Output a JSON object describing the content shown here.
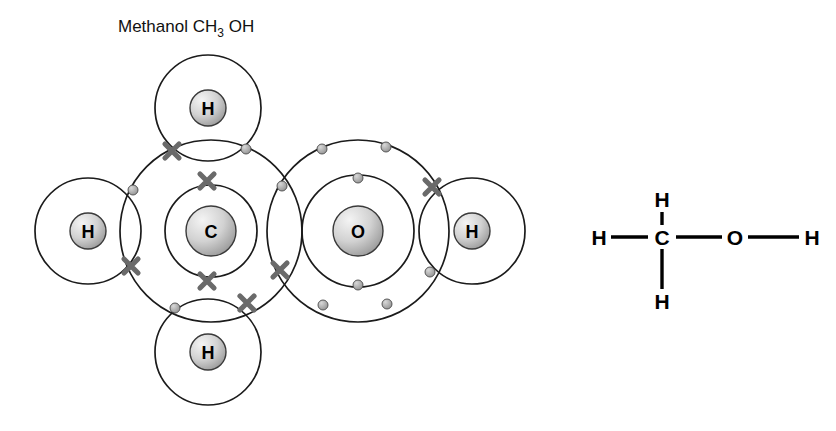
{
  "title": {
    "name_label": "Methanol",
    "formula_main": "CH",
    "formula_sub": "3",
    "formula_tail": "OH",
    "full_text": "Methanol CH3 OH"
  },
  "colors": {
    "background": "#ffffff",
    "shell_stroke": "#1b1b1b",
    "nucleus_fill_light": "#f2f2f2",
    "nucleus_fill_dark": "#9a9a9a",
    "nucleus_stroke": "#3a3a3a",
    "dot_fill": "#9b9b9b",
    "dot_stroke": "#4a4a4a",
    "cross_stroke": "#6a6a6a",
    "bond_stroke": "#000000",
    "text": "#000000"
  },
  "dot_cross_diagram": {
    "name": "dot-and-cross-diagram",
    "legend": {
      "cross_meaning": "carbon electron",
      "dot_meaning": "hydrogen or oxygen electron"
    },
    "atoms": [
      {
        "id": "carbon",
        "symbol": "C",
        "cx": 211,
        "cy": 231,
        "nucleus_r": 25,
        "shells": [
          46,
          91
        ]
      },
      {
        "id": "oxygen",
        "symbol": "O",
        "cx": 358,
        "cy": 231,
        "nucleus_r": 25,
        "shells": [
          56,
          91
        ]
      },
      {
        "id": "hydrogen-top",
        "symbol": "H",
        "cx": 208,
        "cy": 108,
        "nucleus_r": 18,
        "shells": [
          53
        ]
      },
      {
        "id": "hydrogen-bottom",
        "symbol": "H",
        "cx": 208,
        "cy": 352,
        "nucleus_r": 18,
        "shells": [
          53
        ]
      },
      {
        "id": "hydrogen-left",
        "symbol": "H",
        "cx": 88,
        "cy": 231,
        "nucleus_r": 18,
        "shells": [
          53
        ]
      },
      {
        "id": "hydrogen-right",
        "symbol": "H",
        "cx": 472,
        "cy": 231,
        "nucleus_r": 18,
        "shells": [
          53
        ]
      }
    ],
    "electrons": [
      {
        "type": "cross",
        "bond": "C-H-top",
        "x": 172,
        "y": 151
      },
      {
        "type": "dot",
        "bond": "C-H-top",
        "x": 246,
        "y": 149
      },
      {
        "type": "dot",
        "bond": "C-H-left",
        "x": 133,
        "y": 190
      },
      {
        "type": "cross",
        "bond": "C-H-left",
        "x": 131,
        "y": 266
      },
      {
        "type": "dot",
        "bond": "C-H-bottom",
        "x": 175,
        "y": 308
      },
      {
        "type": "cross",
        "bond": "C-H-bottom",
        "x": 247,
        "y": 303
      },
      {
        "type": "dot",
        "bond": "C-O",
        "x": 282,
        "y": 186
      },
      {
        "type": "cross",
        "bond": "C-O",
        "x": 280,
        "y": 270
      },
      {
        "type": "cross",
        "bond": "O-H-right",
        "x": 432,
        "y": 187
      },
      {
        "type": "dot",
        "bond": "O-H-right",
        "x": 430,
        "y": 272
      },
      {
        "type": "cross",
        "shell": "carbon-inner",
        "x": 207,
        "y": 181
      },
      {
        "type": "cross",
        "shell": "carbon-inner",
        "x": 207,
        "y": 281
      },
      {
        "type": "dot",
        "shell": "oxygen-inner",
        "x": 358,
        "y": 178
      },
      {
        "type": "dot",
        "shell": "oxygen-inner",
        "x": 358,
        "y": 285
      },
      {
        "type": "dot",
        "shell": "oxygen-outer-lone-pair-top",
        "x": 322,
        "y": 149
      },
      {
        "type": "dot",
        "shell": "oxygen-outer-lone-pair-top",
        "x": 386,
        "y": 147
      },
      {
        "type": "dot",
        "shell": "oxygen-outer-lone-pair-bottom",
        "x": 323,
        "y": 305
      },
      {
        "type": "dot",
        "shell": "oxygen-outer-lone-pair-bottom",
        "x": 387,
        "y": 304
      }
    ]
  },
  "structural_formula": {
    "name": "structural-formula",
    "atoms": [
      {
        "id": "sf-h-top",
        "symbol": "H",
        "x": 662,
        "y": 199
      },
      {
        "id": "sf-h-left",
        "symbol": "H",
        "x": 599,
        "y": 237
      },
      {
        "id": "sf-carbon",
        "symbol": "C",
        "x": 662,
        "y": 237
      },
      {
        "id": "sf-oxygen",
        "symbol": "O",
        "x": 735,
        "y": 237
      },
      {
        "id": "sf-h-right",
        "symbol": "H",
        "x": 812,
        "y": 237
      },
      {
        "id": "sf-h-bottom",
        "symbol": "H",
        "x": 662,
        "y": 301
      }
    ],
    "bonds": [
      {
        "id": "bond-h-c-left",
        "x1": 611,
        "y1": 237,
        "x2": 648,
        "y2": 237
      },
      {
        "id": "bond-c-o",
        "x1": 676,
        "y1": 237,
        "x2": 722,
        "y2": 237
      },
      {
        "id": "bond-o-h-right",
        "x1": 748,
        "y1": 237,
        "x2": 799,
        "y2": 237
      },
      {
        "id": "bond-c-h-top",
        "x1": 662,
        "y1": 212,
        "x2": 662,
        "y2": 225
      },
      {
        "id": "bond-c-h-bottom",
        "x1": 662,
        "y1": 249,
        "x2": 662,
        "y2": 289
      }
    ]
  }
}
